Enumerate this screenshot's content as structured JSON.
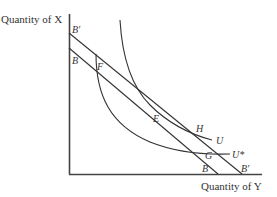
{
  "axes": {
    "y_label": "Quantity of X",
    "x_label": "Quantity of Y"
  },
  "budget_lines": {
    "original_top": "B",
    "original_bottom": "B",
    "shifted_top": "B′",
    "shifted_bottom": "B′"
  },
  "points": {
    "F": "F",
    "E": "E",
    "H": "H",
    "G": "G"
  },
  "curves": {
    "U": "U",
    "U_star": "U*"
  }
}
